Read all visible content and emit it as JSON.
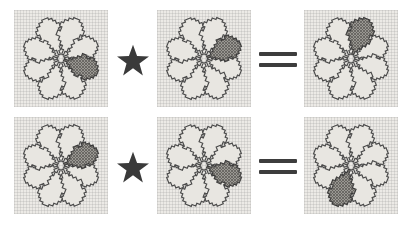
{
  "figure": {
    "description": "Two rows, each showing two eight-petal rosette patterns combined by a star operator to equal a third rosette pattern.",
    "background_color": "#ffffff",
    "canvas_color": "#eceae6",
    "petal_outline_color": "#4a4a4a",
    "petal_fill_color": "#e8e6e1",
    "highlight_fill_color": "#9a9893",
    "operator_color": "#3a3a3a"
  },
  "operators": {
    "star": {
      "name": "star-operator",
      "symbol": "★",
      "label": "star"
    },
    "equals": {
      "name": "equals-operator",
      "symbol": "=",
      "label": "equals"
    }
  },
  "rows": [
    {
      "index": 0,
      "label": "equation-row-1",
      "operands": [
        {
          "slot": "left-operand",
          "panel_label": "rosette-1-1",
          "petal_count": 8,
          "highlighted_petal_index": 3,
          "highlighted_petal_position": "right-lower-diagonal",
          "highlighted_clock_position": "4 o'clock"
        },
        {
          "slot": "right-operand",
          "panel_label": "rosette-1-2",
          "petal_count": 8,
          "highlighted_petal_index": 2,
          "highlighted_petal_position": "right-upper-diagonal",
          "highlighted_clock_position": "2 o'clock"
        }
      ],
      "result": {
        "slot": "result",
        "panel_label": "rosette-1-3",
        "petal_count": 8,
        "highlighted_petal_index": 1,
        "highlighted_petal_position": "top-right-vertical",
        "highlighted_clock_position": "1 o'clock"
      }
    },
    {
      "index": 1,
      "label": "equation-row-2",
      "operands": [
        {
          "slot": "left-operand",
          "panel_label": "rosette-2-1",
          "petal_count": 8,
          "highlighted_petal_index": 2,
          "highlighted_petal_position": "right-upper-diagonal",
          "highlighted_clock_position": "2 o'clock"
        },
        {
          "slot": "right-operand",
          "panel_label": "rosette-2-2",
          "petal_count": 8,
          "highlighted_petal_index": 3,
          "highlighted_petal_position": "right-lower-diagonal",
          "highlighted_clock_position": "4 o'clock"
        }
      ],
      "result": {
        "slot": "result",
        "panel_label": "rosette-2-3",
        "petal_count": 8,
        "highlighted_petal_index": 5,
        "highlighted_petal_position": "bottom-left-vertical",
        "highlighted_clock_position": "7 o'clock"
      }
    }
  ]
}
